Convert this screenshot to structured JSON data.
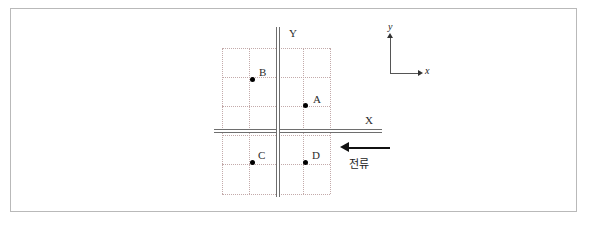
{
  "figure": {
    "background_color": "#ffffff",
    "frame_color": "#b9b9b9"
  },
  "wires": [
    {
      "id": "wire-horizontal",
      "label": "X",
      "orientation": "horizontal",
      "color": "#6e6e6e"
    },
    {
      "id": "wire-vertical",
      "label": "Y",
      "orientation": "vertical",
      "color": "#6e6e6e"
    }
  ],
  "current": {
    "label": "전류",
    "direction": "left",
    "arrow_color": "#111111"
  },
  "points": [
    {
      "label": "A",
      "x": 305,
      "y": 105,
      "label_x": 313,
      "label_y": 94
    },
    {
      "label": "B",
      "x": 252,
      "y": 79,
      "label_x": 259,
      "label_y": 67
    },
    {
      "label": "C",
      "x": 252,
      "y": 162,
      "label_x": 258,
      "label_y": 150
    },
    {
      "label": "D",
      "x": 305,
      "y": 162,
      "label_x": 312,
      "label_y": 150
    }
  ],
  "grid": {
    "left": 222,
    "top": 48,
    "right": 330,
    "bottom": 194,
    "vertical_lines": [
      222,
      249,
      276,
      303,
      330
    ],
    "horizontal_lines": [
      48,
      77,
      106,
      135,
      164,
      194
    ],
    "line_color": "#c3aaaa",
    "style": "dotted"
  },
  "axis_legend": {
    "x_label": "x",
    "y_label": "y",
    "color": "#555555"
  }
}
